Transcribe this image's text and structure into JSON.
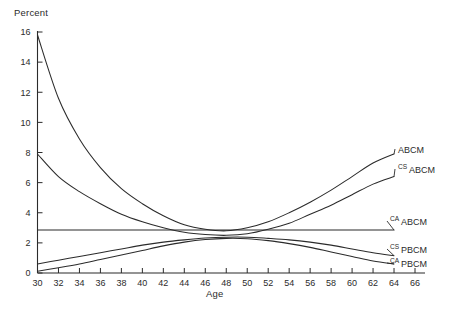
{
  "chart_data": {
    "type": "line",
    "title": "",
    "xlabel": "Age",
    "ylabel": "Percent",
    "xlim": [
      30,
      66
    ],
    "ylim": [
      0,
      16
    ],
    "xticks": [
      30,
      32,
      34,
      36,
      38,
      40,
      42,
      44,
      46,
      48,
      50,
      52,
      54,
      56,
      58,
      60,
      62,
      64,
      66
    ],
    "yticks": [
      0,
      2,
      4,
      6,
      8,
      10,
      12,
      14,
      16
    ],
    "grid": false,
    "legend_position": "right-inline-labels",
    "x": [
      30,
      32,
      34,
      36,
      38,
      40,
      42,
      44,
      46,
      48,
      50,
      52,
      54,
      56,
      58,
      60,
      62,
      64
    ],
    "series": [
      {
        "name": "ABCM",
        "label_main": "ABCM",
        "label_prefix": "",
        "label_sub": "",
        "values": [
          15.8,
          11.6,
          8.9,
          7.0,
          5.6,
          4.6,
          3.8,
          3.2,
          2.9,
          2.8,
          3.0,
          3.4,
          4.0,
          4.7,
          5.5,
          6.4,
          7.3,
          7.9
        ]
      },
      {
        "name": "CS_ABCM",
        "label_main": "ABCM",
        "label_prefix": "CS",
        "label_sub": "ABCM",
        "values": [
          7.9,
          6.4,
          5.4,
          4.6,
          3.9,
          3.4,
          3.0,
          2.7,
          2.55,
          2.5,
          2.6,
          2.9,
          3.3,
          3.9,
          4.5,
          5.2,
          5.9,
          6.4
        ]
      },
      {
        "name": "CA_ABCM",
        "label_main": "ABCM",
        "label_prefix": "CA",
        "label_sub": "ABCM",
        "values": [
          2.85,
          2.85,
          2.85,
          2.85,
          2.85,
          2.85,
          2.85,
          2.85,
          2.85,
          2.85,
          2.85,
          2.85,
          2.85,
          2.85,
          2.85,
          2.85,
          2.85,
          2.85
        ]
      },
      {
        "name": "CS_PBCM",
        "label_main": "PBCM",
        "label_prefix": "CS",
        "label_sub": "PBCM",
        "values": [
          0.6,
          0.85,
          1.1,
          1.35,
          1.6,
          1.85,
          2.05,
          2.2,
          2.32,
          2.38,
          2.38,
          2.3,
          2.2,
          2.05,
          1.85,
          1.6,
          1.35,
          1.15
        ]
      },
      {
        "name": "CA_PBCM",
        "label_main": "PBCM",
        "label_prefix": "CA",
        "label_sub": "PBCM",
        "values": [
          0.12,
          0.35,
          0.6,
          0.9,
          1.2,
          1.5,
          1.8,
          2.05,
          2.22,
          2.3,
          2.28,
          2.15,
          1.95,
          1.7,
          1.4,
          1.1,
          0.8,
          0.6
        ]
      }
    ],
    "colors": {
      "curve": "#2b2b2b",
      "axis": "#2b2b2b",
      "background": "#ffffff"
    }
  }
}
